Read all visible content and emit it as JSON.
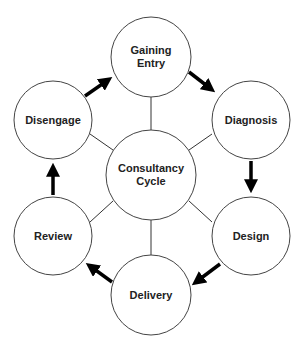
{
  "diagram": {
    "center": {
      "label_line1": "Consultancy",
      "label_line2": "Cycle"
    },
    "nodes": [
      {
        "id": "gaining-entry",
        "line1": "Gaining",
        "line2": "Entry"
      },
      {
        "id": "diagnosis",
        "line1": "Diagnosis"
      },
      {
        "id": "design",
        "line1": "Design"
      },
      {
        "id": "delivery",
        "line1": "Delivery"
      },
      {
        "id": "review",
        "line1": "Review"
      },
      {
        "id": "disengage",
        "line1": "Disengage"
      }
    ],
    "flow": [
      "Gaining Entry",
      "Diagnosis",
      "Design",
      "Delivery",
      "Review",
      "Disengage",
      "Gaining Entry"
    ]
  }
}
